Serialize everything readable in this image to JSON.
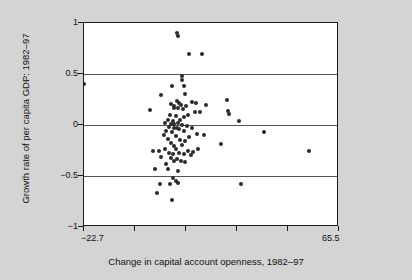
{
  "chart_data": {
    "type": "scatter",
    "title": "",
    "xlabel": "Change in capital account openness, 1982–97",
    "ylabel": "Growth rate of per capita GDP: 1982–97",
    "xlim": [
      -22.7,
      65.5
    ],
    "ylim": [
      -1,
      1
    ],
    "grid": true,
    "legend": null,
    "marker_color": "#2b2b2b",
    "background_color": "#d4d4d4",
    "plot_background_color": "#ffffff",
    "xticks": [
      -22.7,
      65.5
    ],
    "xtick_labels": [
      "−22.7",
      "65.5"
    ],
    "xtick_positions_all": [
      -22.7,
      -5.06,
      12.58,
      30.22,
      47.86,
      65.5
    ],
    "yticks": [
      1,
      0.5,
      0,
      -0.5,
      -1
    ],
    "ytick_labels": [
      "1",
      "0.5",
      "0",
      "−0.5",
      "−1"
    ],
    "gridline_values": [
      0.5,
      0,
      -0.5
    ],
    "points": [
      [
        -22.7,
        0.4
      ],
      [
        9.3,
        0.9
      ],
      [
        9.7,
        0.87
      ],
      [
        13.6,
        0.7
      ],
      [
        18.2,
        0.7
      ],
      [
        11.2,
        0.48
      ],
      [
        11.2,
        0.44
      ],
      [
        65.5,
        0.43
      ],
      [
        7.6,
        0.38
      ],
      [
        11.9,
        0.38
      ],
      [
        4.1,
        0.29
      ],
      [
        12.2,
        0.3
      ],
      [
        26.9,
        0.25
      ],
      [
        9.3,
        0.24
      ],
      [
        10.0,
        0.22
      ],
      [
        14.5,
        0.23
      ],
      [
        16.0,
        0.22
      ],
      [
        7.3,
        0.21
      ],
      [
        8.6,
        0.19
      ],
      [
        10.7,
        0.2
      ],
      [
        12.6,
        0.19
      ],
      [
        19.6,
        0.2
      ],
      [
        8.3,
        0.17
      ],
      [
        9.7,
        0.17
      ],
      [
        11.5,
        0.16
      ],
      [
        0.3,
        0.15
      ],
      [
        27.2,
        0.14
      ],
      [
        27.6,
        0.11
      ],
      [
        15.6,
        0.13
      ],
      [
        17.4,
        0.13
      ],
      [
        7.0,
        0.1
      ],
      [
        9.0,
        0.09
      ],
      [
        11.9,
        0.08
      ],
      [
        13.3,
        0.1
      ],
      [
        6.3,
        0.05
      ],
      [
        8.0,
        0.04
      ],
      [
        10.4,
        0.05
      ],
      [
        30.9,
        0.04
      ],
      [
        5.2,
        0.02
      ],
      [
        7.3,
        0.01
      ],
      [
        8.6,
        0.01
      ],
      [
        9.7,
        0.02
      ],
      [
        11.2,
        0.0
      ],
      [
        12.9,
        -0.01
      ],
      [
        6.6,
        -0.02
      ],
      [
        8.3,
        -0.03
      ],
      [
        9.3,
        -0.03
      ],
      [
        10.0,
        -0.04
      ],
      [
        14.5,
        -0.03
      ],
      [
        5.6,
        -0.06
      ],
      [
        7.6,
        -0.07
      ],
      [
        11.9,
        -0.06
      ],
      [
        16.4,
        -0.09
      ],
      [
        39.5,
        -0.07
      ],
      [
        4.8,
        -0.1
      ],
      [
        9.0,
        -0.11
      ],
      [
        13.6,
        -0.12
      ],
      [
        18.9,
        -0.1
      ],
      [
        6.3,
        -0.14
      ],
      [
        10.4,
        -0.15
      ],
      [
        12.2,
        -0.16
      ],
      [
        7.3,
        -0.18
      ],
      [
        24.8,
        -0.19
      ],
      [
        8.6,
        -0.21
      ],
      [
        11.2,
        -0.2
      ],
      [
        1.0,
        -0.25
      ],
      [
        3.1,
        -0.25
      ],
      [
        5.2,
        -0.24
      ],
      [
        9.0,
        -0.24
      ],
      [
        13.3,
        -0.25
      ],
      [
        15.0,
        -0.26
      ],
      [
        16.7,
        -0.24
      ],
      [
        55.0,
        -0.25
      ],
      [
        6.6,
        -0.27
      ],
      [
        8.0,
        -0.28
      ],
      [
        10.0,
        -0.27
      ],
      [
        11.9,
        -0.28
      ],
      [
        14.2,
        -0.29
      ],
      [
        4.1,
        -0.31
      ],
      [
        7.3,
        -0.32
      ],
      [
        9.3,
        -0.33
      ],
      [
        8.3,
        -0.35
      ],
      [
        10.7,
        -0.35
      ],
      [
        5.6,
        -0.38
      ],
      [
        12.2,
        -0.36
      ],
      [
        1.7,
        -0.43
      ],
      [
        6.3,
        -0.43
      ],
      [
        9.7,
        -0.45
      ],
      [
        8.0,
        -0.52
      ],
      [
        9.0,
        -0.55
      ],
      [
        3.5,
        -0.58
      ],
      [
        7.0,
        -0.58
      ],
      [
        9.7,
        -0.57
      ],
      [
        31.6,
        -0.58
      ],
      [
        2.4,
        -0.67
      ],
      [
        7.6,
        -0.74
      ]
    ]
  }
}
